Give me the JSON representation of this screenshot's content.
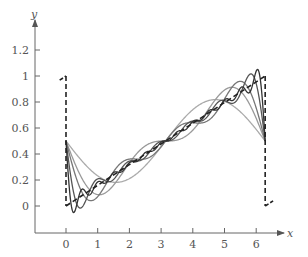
{
  "chart_data": {
    "type": "line",
    "title": "",
    "xlabel": "x",
    "ylabel": "y",
    "xlim": [
      -1,
      6.6
    ],
    "ylim": [
      -0.2,
      1.35
    ],
    "grid": false,
    "legend": null,
    "x_ticks": [
      0,
      1,
      2,
      3,
      4,
      5,
      6
    ],
    "x_tick_labels": [
      "0",
      "1",
      "2",
      "3",
      "4",
      "5",
      "6"
    ],
    "y_ticks": [
      0,
      0.2,
      0.4,
      0.6,
      0.8,
      1,
      1.2
    ],
    "y_tick_labels": [
      "0",
      "0.2",
      "0.4",
      "0.6",
      "0.8",
      "1",
      "1.2"
    ],
    "function": {
      "name": "f(x) = x / (2π), periodic sawtooth",
      "style": "dashed",
      "x_start": 0,
      "x_end": 6.2832,
      "y_start": 0,
      "y_end": 1,
      "jump_at_start": {
        "x": 0,
        "y_from": 1,
        "y_to": 0
      },
      "jump_at_end": {
        "x": 6.2832,
        "y_from": 1,
        "y_to": 0
      },
      "color": "#222222"
    },
    "series": [
      {
        "name": "Fourier partial sum N=1",
        "terms": 1,
        "color": "#aaaaaa",
        "values_at": {
          "x": [
            0,
            0.5,
            1,
            1.57,
            2,
            3.14,
            4.71,
            5.5,
            6.28
          ],
          "y": [
            0.5,
            0.347,
            0.232,
            0.182,
            0.211,
            0.5,
            0.818,
            0.724,
            0.5
          ]
        }
      },
      {
        "name": "Fourier partial sum N=2",
        "terms": 2,
        "color": "#999999"
      },
      {
        "name": "Fourier partial sum N=3",
        "terms": 3,
        "color": "#777777"
      },
      {
        "name": "Fourier partial sum N=6",
        "terms": 6,
        "color": "#555555"
      },
      {
        "name": "Fourier partial sum N=12",
        "terms": 12,
        "color": "#333333"
      }
    ],
    "formula": "S_N(x) = 1/2 - (1/π) Σ_{n=1..N} sin(n x)/n"
  },
  "axes": {
    "x_label": "x",
    "y_label": "y"
  }
}
